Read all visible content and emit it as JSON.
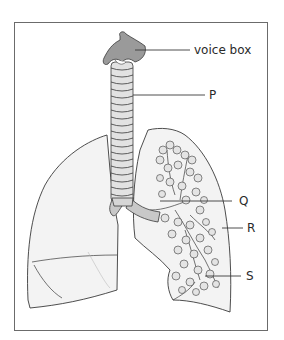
{
  "diagram": {
    "labels": {
      "voice_box": "voice box",
      "p": "P",
      "q": "Q",
      "r": "R",
      "s": "S"
    },
    "colors": {
      "frame": "#6b6b6b",
      "outline": "#3a3a3a",
      "lung_fill": "#f3f3f3",
      "voice_box_fill": "#9a9a9a",
      "airway_fill": "#c8c8c8",
      "text": "#2a2a2a"
    }
  }
}
